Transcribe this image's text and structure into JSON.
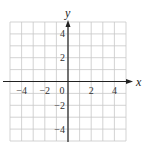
{
  "chart_data": {
    "type": "scatter",
    "title": "",
    "xlabel": "x",
    "ylabel": "y",
    "xlim": [
      -5,
      5
    ],
    "ylim": [
      -5,
      5
    ],
    "grid": true,
    "grid_step": 1,
    "x_ticks": [
      -4,
      -2,
      0,
      2,
      4
    ],
    "y_ticks": [
      4,
      2,
      -2,
      -4
    ],
    "x_tick_labels": [
      "−4",
      "−2",
      "0",
      "2",
      "4"
    ],
    "y_tick_labels": [
      "4",
      "2",
      "−2",
      "−4"
    ],
    "series": [],
    "legend": null
  },
  "labels": {
    "x_axis": "x",
    "y_axis": "y"
  },
  "colors": {
    "grid": "#c8c8c8",
    "axis": "#222222",
    "background": "#ffffff"
  }
}
